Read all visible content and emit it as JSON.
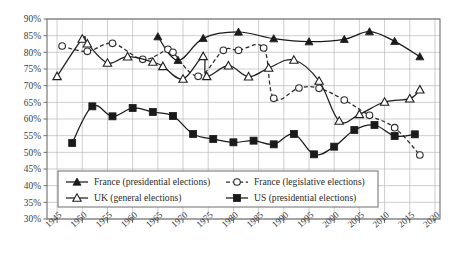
{
  "chart_data": {
    "type": "line",
    "title": "",
    "xlabel": "",
    "ylabel": "",
    "xlim": [
      1943,
      2021
    ],
    "ylim": [
      30,
      90
    ],
    "y_tick_labels": [
      "30%",
      "35%",
      "40%",
      "45%",
      "50%",
      "55%",
      "60%",
      "65%",
      "70%",
      "75%",
      "80%",
      "85%",
      "90%"
    ],
    "y_ticks": [
      30,
      35,
      40,
      45,
      50,
      55,
      60,
      65,
      70,
      75,
      80,
      85,
      90
    ],
    "x_tick_labels": [
      "1945",
      "1950",
      "1955",
      "1960",
      "1965",
      "1970",
      "1975",
      "1980",
      "1985",
      "1990",
      "1995",
      "2000",
      "2005",
      "2010",
      "2015",
      "2020"
    ],
    "x_ticks": [
      1945,
      1950,
      1955,
      1960,
      1965,
      1970,
      1975,
      1980,
      1985,
      1990,
      1995,
      2000,
      2005,
      2010,
      2015,
      2020
    ],
    "grid": true,
    "legend_position": "bottom-left-inside",
    "series": [
      {
        "name": "France (presidential elections)",
        "marker": "filled-triangle",
        "line": "solid",
        "color": "#1a1a1a",
        "points": [
          {
            "x": 1965,
            "y": 84.7
          },
          {
            "x": 1969,
            "y": 77.6
          },
          {
            "x": 1974,
            "y": 84.2
          },
          {
            "x": 1981,
            "y": 86.1
          },
          {
            "x": 1988,
            "y": 84.1
          },
          {
            "x": 1995,
            "y": 83.2
          },
          {
            "x": 2002,
            "y": 83.9
          },
          {
            "x": 2007,
            "y": 86.2
          },
          {
            "x": 2012,
            "y": 83.3
          },
          {
            "x": 2017,
            "y": 78.7
          }
        ]
      },
      {
        "name": "France (legislative elections)",
        "marker": "open-circle",
        "line": "dashed",
        "color": "#2b2b2b",
        "points": [
          {
            "x": 1946,
            "y": 81.9
          },
          {
            "x": 1951,
            "y": 80.3
          },
          {
            "x": 1956,
            "y": 82.7
          },
          {
            "x": 1962,
            "y": 77.9
          },
          {
            "x": 1967,
            "y": 80.9
          },
          {
            "x": 1968,
            "y": 80.0
          },
          {
            "x": 1973,
            "y": 72.8
          },
          {
            "x": 1978,
            "y": 80.6
          },
          {
            "x": 1981,
            "y": 80.6
          },
          {
            "x": 1986,
            "y": 81.3
          },
          {
            "x": 1988,
            "y": 66.2
          },
          {
            "x": 1993,
            "y": 69.3
          },
          {
            "x": 1997,
            "y": 69.2
          },
          {
            "x": 2002,
            "y": 65.7
          },
          {
            "x": 2007,
            "y": 61.1
          },
          {
            "x": 2012,
            "y": 57.4
          },
          {
            "x": 2017,
            "y": 49.2
          }
        ]
      },
      {
        "name": "UK (general elections)",
        "marker": "open-triangle",
        "line": "solid",
        "color": "#1f1f1f",
        "points": [
          {
            "x": 1945,
            "y": 72.8
          },
          {
            "x": 1950,
            "y": 84.0
          },
          {
            "x": 1951,
            "y": 82.6
          },
          {
            "x": 1955,
            "y": 76.8
          },
          {
            "x": 1959,
            "y": 78.7
          },
          {
            "x": 1964,
            "y": 77.1
          },
          {
            "x": 1966,
            "y": 75.8
          },
          {
            "x": 1970,
            "y": 72.0
          },
          {
            "x": 1974,
            "y": 78.8
          },
          {
            "x": 1974.7,
            "y": 72.8
          },
          {
            "x": 1979,
            "y": 76.0
          },
          {
            "x": 1983,
            "y": 72.7
          },
          {
            "x": 1987,
            "y": 75.3
          },
          {
            "x": 1992,
            "y": 77.7
          },
          {
            "x": 1997,
            "y": 71.4
          },
          {
            "x": 2001,
            "y": 59.4
          },
          {
            "x": 2005,
            "y": 61.4
          },
          {
            "x": 2010,
            "y": 65.1
          },
          {
            "x": 2015,
            "y": 66.1
          },
          {
            "x": 2017,
            "y": 68.8
          }
        ]
      },
      {
        "name": "US (presidential elections)",
        "marker": "filled-square",
        "line": "solid",
        "color": "#1a1a1a",
        "points": [
          {
            "x": 1948,
            "y": 52.8
          },
          {
            "x": 1952,
            "y": 63.8
          },
          {
            "x": 1956,
            "y": 60.8
          },
          {
            "x": 1960,
            "y": 63.3
          },
          {
            "x": 1964,
            "y": 62.1
          },
          {
            "x": 1968,
            "y": 60.9
          },
          {
            "x": 1972,
            "y": 55.5
          },
          {
            "x": 1976,
            "y": 54.0
          },
          {
            "x": 1980,
            "y": 53.0
          },
          {
            "x": 1984,
            "y": 53.5
          },
          {
            "x": 1988,
            "y": 52.4
          },
          {
            "x": 1992,
            "y": 55.5
          },
          {
            "x": 1996,
            "y": 49.4
          },
          {
            "x": 2000,
            "y": 51.7
          },
          {
            "x": 2004,
            "y": 56.7
          },
          {
            "x": 2008,
            "y": 58.2
          },
          {
            "x": 2012,
            "y": 54.9
          },
          {
            "x": 2016,
            "y": 55.4
          }
        ]
      }
    ]
  }
}
